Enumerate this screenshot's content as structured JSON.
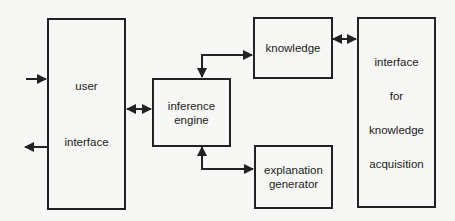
{
  "diagram": {
    "type": "block-diagram",
    "colors": {
      "background": "#f7f7f5",
      "stroke": "#222222"
    },
    "nodes": [
      {
        "id": "user_interface",
        "lines": [
          "user",
          "interface"
        ]
      },
      {
        "id": "inference_engine",
        "lines": [
          "inference",
          "engine"
        ]
      },
      {
        "id": "knowledge",
        "lines": [
          "knowledge"
        ]
      },
      {
        "id": "explanation_generator",
        "lines": [
          "explanation",
          "generator"
        ]
      },
      {
        "id": "knowledge_acquisition_interface",
        "lines": [
          "interface",
          "for",
          "knowledge",
          "acquisition"
        ]
      }
    ],
    "edges": [
      {
        "from": "external",
        "to": "user_interface",
        "direction": "in"
      },
      {
        "from": "user_interface",
        "to": "external",
        "direction": "out"
      },
      {
        "from": "user_interface",
        "to": "inference_engine",
        "direction": "bidirectional"
      },
      {
        "from": "inference_engine",
        "to": "knowledge",
        "direction": "bidirectional"
      },
      {
        "from": "inference_engine",
        "to": "explanation_generator",
        "direction": "bidirectional"
      },
      {
        "from": "knowledge",
        "to": "knowledge_acquisition_interface",
        "direction": "bidirectional"
      }
    ]
  }
}
